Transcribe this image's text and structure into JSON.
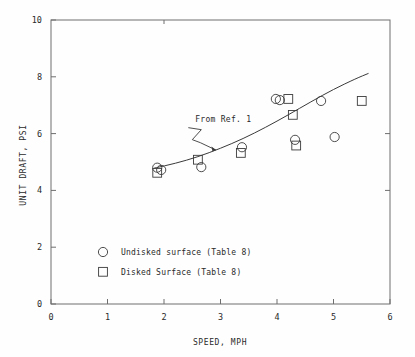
{
  "chart_data": {
    "type": "scatter",
    "title": "",
    "xlabel": "SPEED, MPH",
    "ylabel": "UNIT DRAFT, PSI",
    "xlim": [
      0,
      6
    ],
    "ylim": [
      0,
      10
    ],
    "xticks": [
      0,
      1,
      2,
      3,
      4,
      5,
      6
    ],
    "yticks": [
      0,
      2,
      4,
      6,
      8,
      10
    ],
    "xtick_labels": [
      "0",
      "1",
      "2",
      "3",
      "4",
      "5",
      "6"
    ],
    "ytick_labels": [
      "0",
      "2",
      "4",
      "6",
      "8",
      "10"
    ],
    "grid": false,
    "legend_position": "lower-left-inside",
    "series": [
      {
        "name": "Undisked surface (Table 8)",
        "marker": "circle",
        "points": [
          [
            1.88,
            4.8
          ],
          [
            1.95,
            4.72
          ],
          [
            2.66,
            4.82
          ],
          [
            3.38,
            5.52
          ],
          [
            3.98,
            7.22
          ],
          [
            4.05,
            7.18
          ],
          [
            4.32,
            5.78
          ],
          [
            4.78,
            7.15
          ],
          [
            5.02,
            5.88
          ]
        ]
      },
      {
        "name": "Disked Surface (Table 8)",
        "marker": "square",
        "points": [
          [
            1.88,
            4.62
          ],
          [
            2.6,
            5.08
          ],
          [
            3.36,
            5.32
          ],
          [
            4.2,
            7.22
          ],
          [
            4.28,
            6.66
          ],
          [
            4.34,
            5.58
          ],
          [
            5.5,
            7.15
          ]
        ]
      }
    ],
    "reference_curve": {
      "name": "From Ref. 1",
      "points": [
        [
          1.82,
          4.78
        ],
        [
          2.2,
          4.95
        ],
        [
          2.6,
          5.18
        ],
        [
          3.0,
          5.48
        ],
        [
          3.4,
          5.82
        ],
        [
          3.8,
          6.22
        ],
        [
          4.2,
          6.66
        ],
        [
          4.6,
          7.12
        ],
        [
          5.0,
          7.56
        ],
        [
          5.4,
          7.94
        ],
        [
          5.62,
          8.12
        ]
      ]
    },
    "annotations": [
      {
        "text": "From Ref. 1",
        "x": 3.05,
        "y": 6.42,
        "leader_to_x": 2.92,
        "leader_to_y": 5.42
      }
    ]
  },
  "legend": {
    "items": [
      {
        "label": "Undisked surface (Table 8)",
        "marker": "circle"
      },
      {
        "label": "Disked Surface (Table 8)",
        "marker": "square"
      }
    ]
  },
  "axes": {
    "x_title": "SPEED, MPH",
    "y_title": "UNIT DRAFT, PSI"
  }
}
